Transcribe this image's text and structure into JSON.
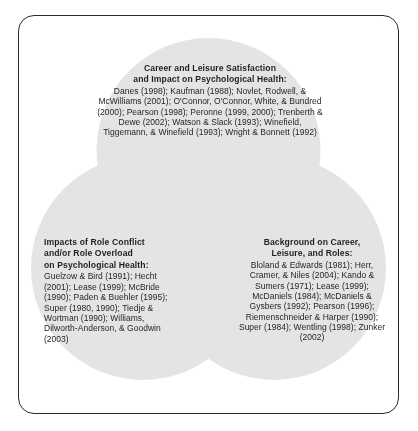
{
  "figure": {
    "kind": "venn-diagram",
    "set_count": 3,
    "border_color": "#2b2b2b",
    "background_color": "#ffffff",
    "circle_fill_color": "#e2e2e2",
    "circle_overlap_color": "#cfcfcf",
    "text_color": "#231f20"
  },
  "sets": {
    "top": {
      "heading_line_1": "Career and Leisure Satisfaction",
      "heading_line_2": "and Impact on Psychological Health:",
      "citations": "Danes (1998); Kaufman (1988); Novlet, Rodwell, & McWilliams (2001); O'Connor, O'Connor, White, & Bundred (2000); Pearson (1998); Peronne (1999, 2000); Trenberth & Dewe (2002); Watson & Slack (1993); Winefield, Tiggemann, & Winefield (1993); Wright & Bonnett (1992)",
      "citation_list": [
        "Danes (1998)",
        "Kaufman (1988)",
        "Novlet, Rodwell, & McWilliams (2001)",
        "O'Connor, O'Connor, White, & Bundred (2000)",
        "Pearson (1998)",
        "Peronne (1999, 2000)",
        "Trenberth & Dewe (2002)",
        "Watson & Slack (1993)",
        "Winefield, Tiggemann, & Winefield (1993)",
        "Wright & Bonnett (1992)"
      ]
    },
    "left": {
      "heading_line_1": "Impacts of Role Conflict",
      "heading_line_2": "and/or Role Overload",
      "heading_line_3": "on Psychological Health:",
      "citations": "Guelzow & Bird (1991); Hecht (2001); Lease (1999); McBride (1990); Paden & Buehler (1995); Super (1980, 1990); Tiedje & Wortman (1990); Williams, Dilworth-Anderson, & Goodwin (2003)",
      "citation_list": [
        "Guelzow & Bird (1991)",
        "Hecht (2001)",
        "Lease (1999)",
        "McBride (1990)",
        "Paden & Buehler (1995)",
        "Super (1980, 1990)",
        "Tiedje & Wortman (1990)",
        "Williams, Dilworth-Anderson, & Goodwin (2003)"
      ]
    },
    "right": {
      "heading_line_1": "Background on Career,",
      "heading_line_2": "Leisure, and Roles:",
      "citations": "Bloland & Edwards (1981); Herr, Cramer, & Niles (2004); Kando & Sumers (1971); Lease (1999); McDaniels (1984); McDaniels & Gysbers (1992); Pearson (1996); Riemenschneider & Harper (1990); Super (1984); Wentling (1998); Zunker (2002)",
      "citation_list": [
        "Bloland & Edwards (1981)",
        "Herr, Cramer, & Niles (2004)",
        "Kando & Sumers (1971)",
        "Lease (1999)",
        "McDaniels (1984)",
        "McDaniels & Gysbers (1992)",
        "Pearson (1996)",
        "Riemenschneider & Harper (1990)",
        "Super (1984)",
        "Wentling (1998)",
        "Zunker (2002)"
      ]
    }
  }
}
